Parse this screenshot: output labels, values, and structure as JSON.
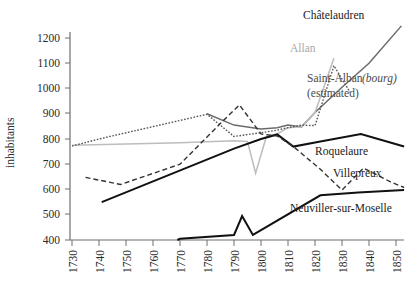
{
  "chart_data": {
    "type": "line",
    "title": "",
    "xlabel": "",
    "ylabel": "inhabitants",
    "xlim": [
      1730,
      1855
    ],
    "ylim": [
      400,
      1250
    ],
    "xticks": [
      1730,
      1740,
      1750,
      1760,
      1770,
      1780,
      1790,
      1800,
      1810,
      1820,
      1830,
      1840,
      1850
    ],
    "yticks": [
      400,
      500,
      600,
      700,
      800,
      900,
      1000,
      1100,
      1200
    ],
    "grid": false,
    "legend_position": "inline-annotations",
    "series": [
      {
        "name": "Châtelaudren",
        "label": "Châtelaudren",
        "style": "solid-gray",
        "color": "#6b6b6b",
        "x": [
          1780,
          1790,
          1800,
          1806,
          1810,
          1815,
          1820,
          1830,
          1840,
          1852
        ],
        "y": [
          900,
          855,
          840,
          845,
          855,
          848,
          905,
          1005,
          1100,
          1248
        ]
      },
      {
        "name": "Allan",
        "label": "Allan",
        "style": "solid-lightgray",
        "color": "#bdbdbd",
        "x": [
          1730,
          1770,
          1790,
          1795,
          1798,
          1802,
          1806,
          1810,
          1815,
          1820,
          1827
        ],
        "y": [
          775,
          785,
          793,
          790,
          665,
          810,
          820,
          845,
          848,
          905,
          1120
        ]
      },
      {
        "name": "Saint-Alban (bourg) (estimated)",
        "label": "Saint-Alban",
        "label_italic": "bourg",
        "label_sub": "(estimated)",
        "style": "dotted",
        "color": "#555555",
        "x": [
          1730,
          1740,
          1780,
          1790,
          1800,
          1806,
          1810,
          1815,
          1820,
          1827,
          1833
        ],
        "y": [
          772,
          800,
          898,
          810,
          825,
          835,
          845,
          855,
          853,
          1090,
          985
        ]
      },
      {
        "name": "Roquelaure",
        "label": "Roquelaure",
        "style": "solid-black",
        "color": "#111111",
        "x": [
          1741,
          1790,
          1800,
          1806,
          1812,
          1822,
          1837,
          1853
        ],
        "y": [
          550,
          762,
          800,
          818,
          770,
          790,
          820,
          770
        ]
      },
      {
        "name": "Villepreux",
        "label": "Villepreux",
        "style": "dashed",
        "color": "#333333",
        "x": [
          1735,
          1748,
          1770,
          1785,
          1792,
          1800,
          1806,
          1812,
          1822,
          1830,
          1838,
          1848,
          1853
        ],
        "y": [
          648,
          620,
          700,
          862,
          935,
          820,
          812,
          770,
          680,
          598,
          685,
          630,
          608
        ]
      },
      {
        "name": "Neuviller-sur-Moselle",
        "label": "Neuviller-sur-Moselle",
        "style": "solid-black",
        "color": "#111111",
        "x": [
          1769,
          1770,
          1790,
          1793,
          1797,
          1822,
          1836,
          1853
        ],
        "y": [
          400,
          405,
          420,
          495,
          420,
          577,
          588,
          598
        ]
      }
    ],
    "annotations": [
      {
        "id": "chatelaudren",
        "text": "Châtelaudren",
        "x": 1838,
        "y": 1245
      },
      {
        "id": "allan",
        "text": "Allan",
        "x": 1825,
        "y": 1140
      },
      {
        "id": "saint-alban",
        "text": "Saint-Alban (bourg)",
        "x": 1838,
        "y": 1010
      },
      {
        "id": "saint-alban-estimated",
        "text": "(estimated)",
        "x": 1838,
        "y": 960
      },
      {
        "id": "roquelaure",
        "text": "Roquelaure",
        "x": 1832,
        "y": 740
      },
      {
        "id": "villepreux",
        "text": "Villepreux",
        "x": 1845,
        "y": 658
      },
      {
        "id": "neuviller",
        "text": "Neuviller-sur-Moselle",
        "x": 1812,
        "y": 540
      }
    ]
  },
  "labels": {
    "y_axis_title": "inhabitants",
    "chatelaudren": "Châtelaudren",
    "allan": "Allan",
    "saint_alban_main": "Saint-Alban",
    "saint_alban_italic": "(bourg)",
    "saint_alban_estimated": "(estimated)",
    "roquelaure": "Roquelaure",
    "villepreux": "Villepreux",
    "neuviller": "Neuviller-sur-Moselle"
  },
  "ticks": {
    "y": [
      "400",
      "500",
      "600",
      "700",
      "800",
      "900",
      "1000",
      "1100",
      "1200"
    ],
    "x": [
      "1730",
      "1740",
      "1750",
      "1760",
      "1770",
      "1780",
      "1790",
      "1800",
      "1810",
      "1820",
      "1830",
      "1840",
      "1850"
    ]
  },
  "colors": {
    "axis": "#6e6e6e",
    "chatelaudren": "#6b6b6b",
    "allan": "#bdbdbd",
    "saint_alban": "#555555",
    "roquelaure": "#111111",
    "villepreux": "#333333",
    "neuviller": "#111111",
    "background": "#ffffff"
  }
}
